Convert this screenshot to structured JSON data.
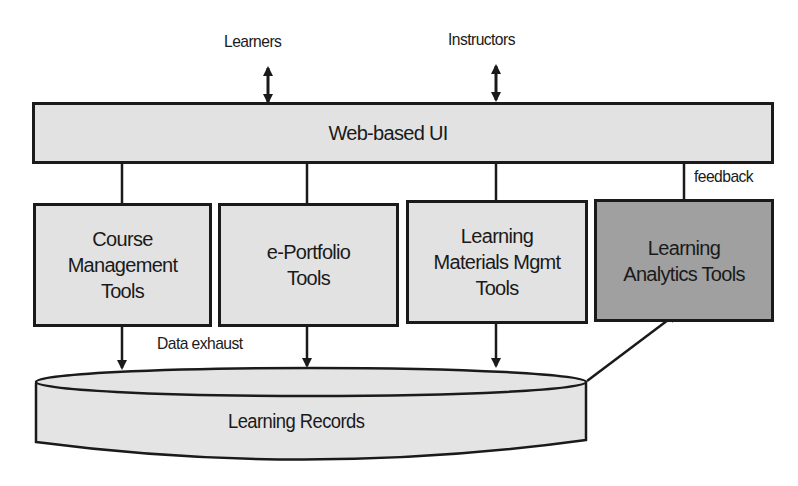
{
  "diagram": {
    "actors": {
      "learners": "Learners",
      "instructors": "Instructors"
    },
    "ui_layer": {
      "label": "Web-based UI"
    },
    "tools": [
      {
        "line1": "Course",
        "line2": "Management",
        "line3": "Tools"
      },
      {
        "line1": "e-Portfolio",
        "line2": "Tools"
      },
      {
        "line1": "Learning",
        "line2": "Materials Mgmt",
        "line3": "Tools"
      },
      {
        "line1": "Learning",
        "line2": "Analytics Tools",
        "highlight": true
      }
    ],
    "edge_labels": {
      "feedback": "feedback",
      "data_exhaust": "Data exhaust"
    },
    "store": {
      "label": "Learning Records"
    },
    "colors": {
      "box_fill": "#e2e2e2",
      "highlight_fill": "#a0a0a0",
      "stroke": "#1a1a1a"
    }
  }
}
